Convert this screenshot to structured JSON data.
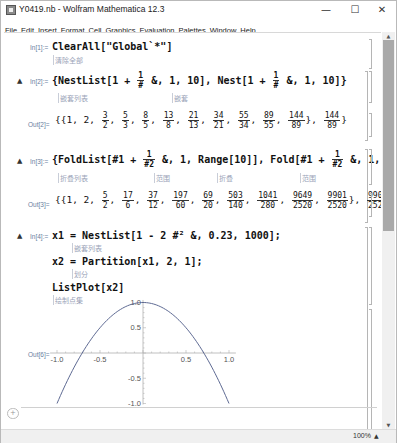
{
  "window": {
    "title": "Y0419.nb - Wolfram Mathematica 12.3",
    "controls": {
      "minimize": "—",
      "maximize": "☐",
      "close": "✕"
    }
  },
  "menu": [
    "File",
    "Edit",
    "Insert",
    "Format",
    "Cell",
    "Graphics",
    "Evaluation",
    "Palettes",
    "Window",
    "Help"
  ],
  "cells": {
    "in1": {
      "label": "In[1]:=",
      "code": "ClearAll[\"Global`*\"]",
      "hint": "清除全部"
    },
    "in2": {
      "label": "In[2]:=",
      "code_a": "{NestList[1 +",
      "frac_num": "1",
      "frac_den": "#",
      "code_b": "&, 1, 10], Nest[1 +",
      "code_c": "&, 1, 10]}",
      "hint_a": "嵌套列表",
      "hint_b": "嵌套"
    },
    "out2": {
      "label": "Out[2]=",
      "prefix": "{{1, 2,",
      "fractions": [
        {
          "n": "3",
          "d": "2"
        },
        {
          "n": "5",
          "d": "3"
        },
        {
          "n": "8",
          "d": "5"
        },
        {
          "n": "13",
          "d": "8"
        },
        {
          "n": "21",
          "d": "13"
        },
        {
          "n": "34",
          "d": "21"
        },
        {
          "n": "55",
          "d": "34"
        },
        {
          "n": "89",
          "d": "55"
        },
        {
          "n": "144",
          "d": "89"
        }
      ],
      "last": {
        "n": "144",
        "d": "89"
      }
    },
    "in3": {
      "label": "In[3]:=",
      "code_a": "{FoldList[#1 +",
      "frac_num": "1",
      "frac_den": "#2",
      "code_b": "&, 1, Range[10]], Fold[#1 +",
      "code_c": "&, 1, Range[10]]}",
      "hint_a": "折叠列表",
      "hint_b": "范围",
      "hint_c": "折叠",
      "hint_d": "范围"
    },
    "out3": {
      "label": "Out[3]=",
      "prefix": "{{1, 2,",
      "fractions": [
        {
          "n": "5",
          "d": "2"
        },
        {
          "n": "17",
          "d": "6"
        },
        {
          "n": "37",
          "d": "12"
        },
        {
          "n": "197",
          "d": "60"
        },
        {
          "n": "69",
          "d": "20"
        },
        {
          "n": "503",
          "d": "140"
        },
        {
          "n": "1041",
          "d": "280"
        },
        {
          "n": "9649",
          "d": "2520"
        },
        {
          "n": "9901",
          "d": "2520"
        }
      ],
      "last": {
        "n": "9901",
        "d": "2520"
      }
    },
    "in4": {
      "label": "In[4]:=",
      "line1": "x1 = NestList[1 - 2 #² &, 0.23, 1000];",
      "hint1": "嵌套列表",
      "line2": "x2 = Partition[x1, 2, 1];",
      "hint2": "划分",
      "line3": "ListPlot[x2]",
      "hint3": "绘制点集"
    },
    "out6": {
      "label": "Out[6]="
    }
  },
  "chart_data": {
    "type": "scatter",
    "title": "",
    "xlabel": "",
    "ylabel": "",
    "x_ticks": [
      "-1.0",
      "-0.5",
      "0.5",
      "1.0"
    ],
    "y_ticks": [
      "1.0",
      "0.5",
      "-0.5",
      "-1.0"
    ],
    "xlim": [
      -1,
      1
    ],
    "ylim": [
      -1,
      1
    ],
    "x": [
      -1.0,
      -0.9,
      -0.8,
      -0.7,
      -0.6,
      -0.5,
      -0.4,
      -0.3,
      -0.2,
      -0.1,
      0.0,
      0.1,
      0.2,
      0.3,
      0.4,
      0.5,
      0.6,
      0.7,
      0.8,
      0.9,
      1.0
    ],
    "y": [
      -1.0,
      -0.62,
      -0.28,
      0.02,
      0.28,
      0.5,
      0.68,
      0.82,
      0.92,
      0.98,
      1.0,
      0.98,
      0.92,
      0.82,
      0.68,
      0.5,
      0.28,
      0.02,
      -0.28,
      -0.62,
      -1.0
    ],
    "grid": false,
    "legend": null
  },
  "status": {
    "zoom": "100%",
    "zoom_arrow": "▲"
  },
  "input_bar": {
    "plus": "+"
  }
}
